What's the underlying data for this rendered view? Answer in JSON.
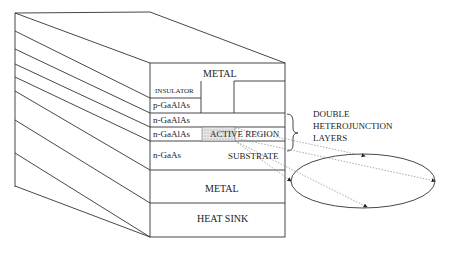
{
  "diagram": {
    "title": "",
    "layers": [
      {
        "label": "METAL",
        "region": "top contact"
      },
      {
        "label": "INSULATOR",
        "region": "top"
      },
      {
        "label": "p-GaAlAs"
      },
      {
        "label": "n-GaAlAs"
      },
      {
        "label": "n-GaAlAs"
      },
      {
        "label": "n-GaAs"
      },
      {
        "label": "METAL",
        "region": "bottom contact"
      },
      {
        "label": "HEAT SINK"
      }
    ],
    "annotations": {
      "active_region": "ACTIVE REGION",
      "substrate": "SUBSTRATE",
      "double_heterojunction": [
        "DOUBLE",
        "HETEROJUNCTION",
        "LAYERS"
      ]
    },
    "colors": {
      "line": "#333333",
      "hatch": "#cfcfcf",
      "dotted": "#888888"
    }
  }
}
